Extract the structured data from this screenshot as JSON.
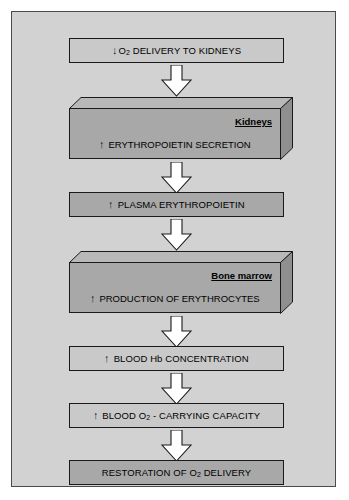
{
  "diagram": {
    "canvas_color": "#d2d2d2",
    "frame_color": "#4a4a4a",
    "arrow_fill": "#ffffff",
    "arrow_stroke": "#1a1a1a",
    "box_fill_light": "#c9c9c9",
    "box_fill_dark": "#a8a8a8",
    "slab_top_fill": "#b8b8b8",
    "slab_side_fill": "#8f8f8f",
    "steps": [
      {
        "id": "o2-delivery-to-kidneys",
        "kind": "box",
        "trend": "down",
        "trend_symbol": "↓",
        "text_before": "O",
        "subscript": "2",
        "text_after": " DELIVERY TO KIDNEYS",
        "plain_text": "↓ O2 DELIVERY TO KIDNEYS",
        "fill": "light"
      },
      {
        "id": "erythropoietin-secretion",
        "kind": "slab",
        "organ": "Kidneys",
        "trend": "up",
        "trend_symbol": "↑",
        "plain_text": "↑ ERYTHROPOIETIN SECRETION",
        "text_after": " ERYTHROPOIETIN SECRETION",
        "fill": "dark"
      },
      {
        "id": "plasma-erythropoietin",
        "kind": "box",
        "trend": "up",
        "trend_symbol": "↑",
        "plain_text": "↑ PLASMA ERYTHROPOIETIN",
        "text_after": " PLASMA ERYTHROPOIETIN",
        "fill": "dark"
      },
      {
        "id": "production-of-erythrocytes",
        "kind": "slab",
        "organ": "Bone marrow",
        "trend": "up",
        "trend_symbol": "↑",
        "plain_text": "↑ PRODUCTION OF ERYTHROCYTES",
        "text_after": " PRODUCTION OF ERYTHROCYTES",
        "fill": "dark"
      },
      {
        "id": "blood-hb-concentration",
        "kind": "box",
        "trend": "up",
        "trend_symbol": "↑",
        "plain_text": "↑ BLOOD Hb CONCENTRATION",
        "text_after": " BLOOD Hb CONCENTRATION",
        "fill": "light"
      },
      {
        "id": "blood-o2-carrying-capacity",
        "kind": "box",
        "trend": "up",
        "trend_symbol": "↑",
        "text_before": " BLOOD O",
        "subscript": "2",
        "text_after": " - CARRYING CAPACITY",
        "plain_text": "↑ BLOOD O2 - CARRYING CAPACITY",
        "fill": "light"
      },
      {
        "id": "restoration-of-o2-delivery",
        "kind": "box",
        "trend": "none",
        "trend_symbol": "",
        "text_before": "RESTORATION OF O",
        "subscript": "2",
        "text_after": " DELIVERY",
        "plain_text": "RESTORATION OF O2 DELIVERY",
        "fill": "dark"
      }
    ],
    "connectors": [
      {
        "id": "connector-1",
        "from": "o2-delivery-to-kidneys",
        "to": "erythropoietin-secretion",
        "direction": "down"
      },
      {
        "id": "connector-2",
        "from": "erythropoietin-secretion",
        "to": "plasma-erythropoietin",
        "direction": "down"
      },
      {
        "id": "connector-3",
        "from": "plasma-erythropoietin",
        "to": "production-of-erythrocytes",
        "direction": "down"
      },
      {
        "id": "connector-4",
        "from": "production-of-erythrocytes",
        "to": "blood-hb-concentration",
        "direction": "down"
      },
      {
        "id": "connector-5",
        "from": "blood-hb-concentration",
        "to": "blood-o2-carrying-capacity",
        "direction": "down"
      },
      {
        "id": "connector-6",
        "from": "blood-o2-carrying-capacity",
        "to": "restoration-of-o2-delivery",
        "direction": "down"
      }
    ]
  }
}
